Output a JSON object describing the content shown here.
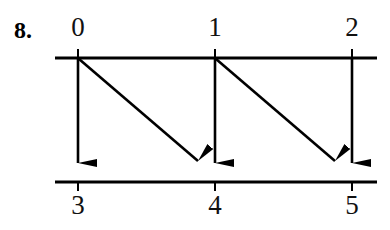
{
  "figure": {
    "number_label": "8.",
    "background_color": "#ffffff",
    "ink_color": "#000000",
    "width": 390,
    "height": 230
  },
  "diagram": {
    "type": "mapping-diagram",
    "top_row": {
      "line_y": 58,
      "line_x_start": 55,
      "line_x_end": 377,
      "nodes": [
        {
          "label": "0",
          "x": 78
        },
        {
          "label": "1",
          "x": 215
        },
        {
          "label": "2",
          "x": 352
        }
      ]
    },
    "bottom_row": {
      "line_y": 182,
      "line_x_start": 55,
      "line_x_end": 377,
      "nodes": [
        {
          "label": "3",
          "x": 78
        },
        {
          "label": "4",
          "x": 215
        },
        {
          "label": "5",
          "x": 352
        }
      ]
    },
    "arrows": [
      {
        "from": "0",
        "to": "3",
        "kind": "vertical"
      },
      {
        "from": "0",
        "to": "4",
        "kind": "diagonal"
      },
      {
        "from": "1",
        "to": "4",
        "kind": "vertical"
      },
      {
        "from": "1",
        "to": "5",
        "kind": "diagonal"
      },
      {
        "from": "2",
        "to": "5",
        "kind": "vertical"
      }
    ]
  },
  "labels": {
    "top_0": "0",
    "top_1": "1",
    "top_2": "2",
    "bottom_3": "3",
    "bottom_4": "4",
    "bottom_5": "5"
  }
}
